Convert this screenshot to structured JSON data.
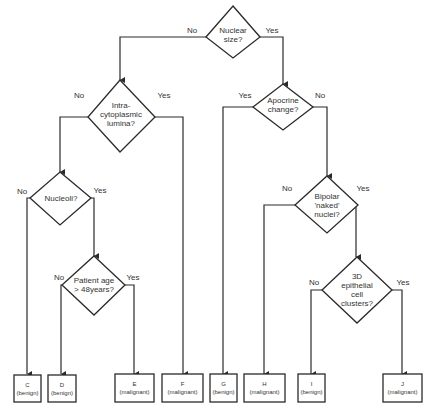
{
  "diagram": {
    "type": "decision-tree",
    "decisions": {
      "nuclear_size": {
        "lines": [
          "Nuclear",
          "size?"
        ],
        "no": "No",
        "yes": "Yes"
      },
      "intracytoplasmic": {
        "lines": [
          "Intra-",
          "cytoplasmic",
          "lumina?"
        ],
        "no": "No",
        "yes": "Yes"
      },
      "apocrine": {
        "lines": [
          "Apocrine",
          "change?"
        ],
        "no": "No",
        "yes": "Yes"
      },
      "nucleoli": {
        "lines": [
          "Nucleoli?"
        ],
        "no": "No",
        "yes": "Yes"
      },
      "patient_age": {
        "lines": [
          "Patient age",
          "> 48years?"
        ],
        "no": "No",
        "yes": "Yes"
      },
      "bipolar": {
        "lines": [
          "Bipolar",
          "'naked'",
          "nuclei?"
        ],
        "no": "No",
        "yes": "Yes"
      },
      "epithelial": {
        "lines": [
          "3D",
          "epithelial",
          "cell",
          "clusters?"
        ],
        "no": "No",
        "yes": "Yes"
      }
    },
    "outcomes": {
      "C": {
        "letter": "C",
        "label": "(benign)"
      },
      "D": {
        "letter": "D",
        "label": "(benign)"
      },
      "E": {
        "letter": "E",
        "label": "(malignant)"
      },
      "F": {
        "letter": "F",
        "label": "(malignant)"
      },
      "G": {
        "letter": "G",
        "label": "(benign)"
      },
      "H": {
        "letter": "H",
        "label": "(malignant)"
      },
      "I": {
        "letter": "I",
        "label": "(benign)"
      },
      "J": {
        "letter": "J",
        "label": "(malignant)"
      }
    }
  }
}
